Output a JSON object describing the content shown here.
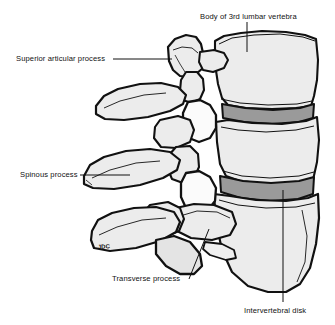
{
  "figure": {
    "background_color": "#ffffff",
    "ink_color": "#111111",
    "bone_fill_color": "#e9e9e9",
    "bone_fill_light_color": "#f4f4f4",
    "disk_fill_color": "#9a9a9a",
    "shadow_fill_color": "#d2d2d2",
    "artist_signature": "JDC"
  },
  "labels": {
    "body_3rd_lumbar_vertebra": "Body of 3rd lumbar vertebra",
    "superior_articular_process": "Superior articular process",
    "spinous_process": "Spinous process",
    "transverse_process": "Transverse process",
    "intervertebral_disk": "Intervertebral disk"
  },
  "anatomy": {
    "structures": [
      "Body of 3rd lumbar vertebra",
      "Superior articular process",
      "Spinous process",
      "Transverse process",
      "Intervertebral disk"
    ],
    "vertebrae_count": 3,
    "disk_count": 2,
    "view": "lateral"
  }
}
